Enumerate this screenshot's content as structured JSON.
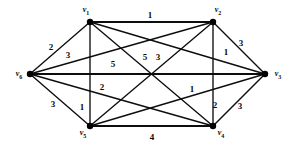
{
  "figure": {
    "background_color": "#ffffff",
    "stroke_color": "#0d0d0d"
  },
  "graph": {
    "vertices": [
      {
        "id": "v1",
        "name": "v",
        "sub": "1",
        "x": 90,
        "y": 22,
        "label_x": 86,
        "label_y": 11
      },
      {
        "id": "v2",
        "name": "v",
        "sub": "2",
        "x": 213,
        "y": 22,
        "label_x": 218,
        "label_y": 11
      },
      {
        "id": "v3",
        "name": "v",
        "sub": "3",
        "x": 265,
        "y": 74,
        "label_x": 278,
        "label_y": 75
      },
      {
        "id": "v4",
        "name": "v",
        "sub": "4",
        "x": 213,
        "y": 126,
        "label_x": 221,
        "label_y": 134
      },
      {
        "id": "v5",
        "name": "v",
        "sub": "5",
        "x": 90,
        "y": 126,
        "label_x": 83,
        "label_y": 134
      },
      {
        "id": "v6",
        "name": "v",
        "sub": "6",
        "x": 30,
        "y": 74,
        "label_x": 19,
        "label_y": 75
      }
    ],
    "edges": [
      {
        "from": "v1",
        "to": "v2",
        "weight": "1",
        "label_x": 150,
        "label_y": 15
      },
      {
        "from": "v1",
        "to": "v6",
        "weight": "2",
        "label_x": 51,
        "label_y": 47
      },
      {
        "from": "v2",
        "to": "v6",
        "weight": "3",
        "label_x": 68,
        "label_y": 55
      },
      {
        "from": "v2",
        "to": "v3",
        "weight": "3",
        "label_x": 241,
        "label_y": 43
      },
      {
        "from": "v2",
        "to": "v4",
        "weight": "1",
        "label_x": 226,
        "label_y": 52
      },
      {
        "from": "v6",
        "to": "v3",
        "weight": "5",
        "label_x": 113,
        "label_y": 64
      },
      {
        "from": "v1",
        "to": "v4",
        "weight": "5",
        "label_x": 145,
        "label_y": 57
      },
      {
        "from": "v2",
        "to": "v5",
        "weight": "3",
        "label_x": 158,
        "label_y": 57
      },
      {
        "from": "v1",
        "to": "v5",
        "weight": "2",
        "label_x": 102,
        "label_y": 87
      },
      {
        "from": "v6",
        "to": "v4",
        "weight": "1",
        "label_x": 192,
        "label_y": 89
      },
      {
        "from": "v6",
        "to": "v5",
        "weight": "3",
        "label_x": 53,
        "label_y": 104
      },
      {
        "from": "v1",
        "to": "v3",
        "weight": "1",
        "label_x": 82,
        "label_y": 107
      },
      {
        "from": "v3",
        "to": "v5",
        "weight": "2",
        "label_x": 215,
        "label_y": 105
      },
      {
        "from": "v3",
        "to": "v4",
        "weight": "3",
        "label_x": 240,
        "label_y": 106
      },
      {
        "from": "v5",
        "to": "v4",
        "weight": "4",
        "label_x": 152,
        "label_y": 137
      }
    ]
  }
}
